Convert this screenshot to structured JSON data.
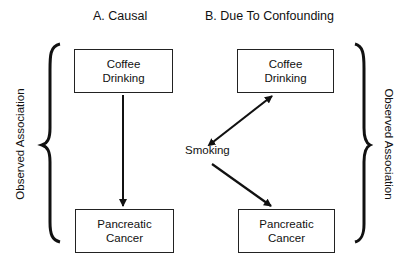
{
  "panels": {
    "causal": {
      "title": "A. Causal",
      "top_box": {
        "line1": "Coffee",
        "line2": "Drinking"
      },
      "bottom_box": {
        "line1": "Pancreatic",
        "line2": "Cancer"
      },
      "arrow": "Coffee Drinking -> Pancreatic Cancer"
    },
    "confounding": {
      "title": "B. Due To Confounding",
      "top_box": {
        "line1": "Coffee",
        "line2": "Drinking"
      },
      "bottom_box": {
        "line1": "Pancreatic",
        "line2": "Cancer"
      },
      "confounder": "Smoking",
      "arrows": [
        "Smoking <-> Coffee Drinking",
        "Smoking -> Pancreatic Cancer"
      ]
    }
  },
  "brackets": {
    "left_label": "Observed Association",
    "right_label": "Observed Association"
  },
  "colors": {
    "line": "#111111",
    "background": "#ffffff"
  }
}
